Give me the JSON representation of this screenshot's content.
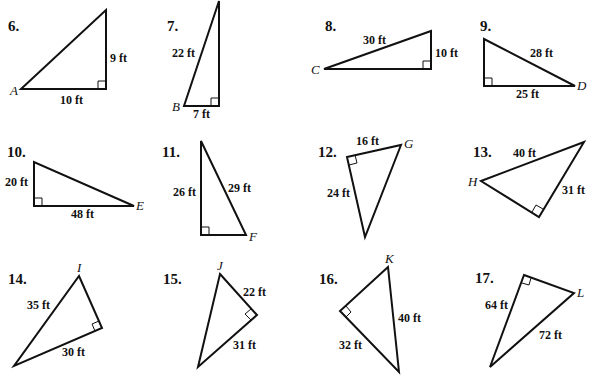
{
  "worksheet": {
    "problems": [
      {
        "number": "6.",
        "vertex_label": "A",
        "leg_a": "9 ft",
        "leg_b": "10 ft",
        "hypotenuse": null,
        "sides": [
          "9 ft",
          "10 ft"
        ]
      },
      {
        "number": "7.",
        "vertex_label": "B",
        "leg_a": "7 ft",
        "leg_b": null,
        "hypotenuse": "22 ft",
        "sides": [
          "22 ft",
          "7 ft"
        ]
      },
      {
        "number": "8.",
        "vertex_label": "C",
        "leg_a": "10 ft",
        "leg_b": null,
        "hypotenuse": "30 ft",
        "sides": [
          "30 ft",
          "10 ft"
        ]
      },
      {
        "number": "9.",
        "vertex_label": "D",
        "leg_a": "25 ft",
        "leg_b": null,
        "hypotenuse": "28 ft",
        "sides": [
          "28 ft",
          "25 ft"
        ]
      },
      {
        "number": "10.",
        "vertex_label": "E",
        "leg_a": "20 ft",
        "leg_b": "48 ft",
        "hypotenuse": null,
        "sides": [
          "20 ft",
          "48 ft"
        ]
      },
      {
        "number": "11.",
        "vertex_label": "F",
        "leg_a": "26 ft",
        "leg_b": null,
        "hypotenuse": "29 ft",
        "sides": [
          "26 ft",
          "29 ft"
        ]
      },
      {
        "number": "12.",
        "vertex_label": "G",
        "leg_a": "16 ft",
        "leg_b": "24 ft",
        "hypotenuse": null,
        "sides": [
          "16 ft",
          "24 ft"
        ]
      },
      {
        "number": "13.",
        "vertex_label": "H",
        "leg_a": "31 ft",
        "leg_b": null,
        "hypotenuse": "40 ft",
        "sides": [
          "40 ft",
          "31 ft"
        ]
      },
      {
        "number": "14.",
        "vertex_label": "I",
        "leg_a": "30 ft",
        "leg_b": null,
        "hypotenuse": "35 ft",
        "sides": [
          "35 ft",
          "30 ft"
        ]
      },
      {
        "number": "15.",
        "vertex_label": "J",
        "leg_a": "22 ft",
        "leg_b": "31 ft",
        "hypotenuse": null,
        "sides": [
          "22 ft",
          "31 ft"
        ]
      },
      {
        "number": "16.",
        "vertex_label": "K",
        "leg_a": "32 ft",
        "leg_b": null,
        "hypotenuse": "40 ft",
        "sides": [
          "40 ft",
          "32 ft"
        ]
      },
      {
        "number": "17.",
        "vertex_label": "L",
        "leg_a": "64 ft",
        "leg_b": null,
        "hypotenuse": "72 ft",
        "sides": [
          "64 ft",
          "72 ft"
        ]
      }
    ]
  }
}
